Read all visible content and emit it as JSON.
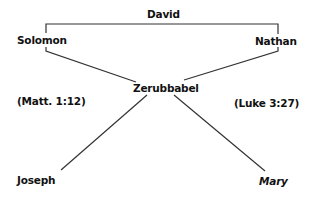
{
  "diagram": {
    "nodes": {
      "david": "David",
      "solomon": "Solomon",
      "nathan": "Nathan",
      "zerubbabel": "Zerubbabel",
      "joseph": "Joseph",
      "mary": "Mary"
    },
    "references": {
      "matthew": "(Matt. 1:12)",
      "luke": "(Luke 3:27)"
    },
    "edges": [
      {
        "from": "david",
        "to": "solomon"
      },
      {
        "from": "david",
        "to": "nathan"
      },
      {
        "from": "solomon",
        "to": "zerubbabel"
      },
      {
        "from": "nathan",
        "to": "zerubbabel"
      },
      {
        "from": "zerubbabel",
        "to": "joseph"
      },
      {
        "from": "zerubbabel",
        "to": "mary"
      }
    ],
    "line_color": "#333333",
    "text_color": "#111111"
  }
}
